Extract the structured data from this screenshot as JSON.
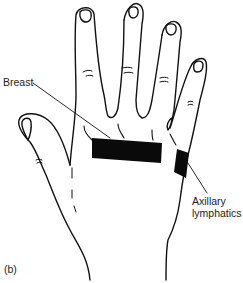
{
  "figure": {
    "panel_label": "(b)",
    "labels": {
      "breast": "Breast",
      "axillary_line1": "Axillary",
      "axillary_line2": "lymphatics"
    },
    "colors": {
      "outline": "#111111",
      "band_fill": "#0a0a0a",
      "background": "#ffffff",
      "text": "#222222"
    }
  }
}
